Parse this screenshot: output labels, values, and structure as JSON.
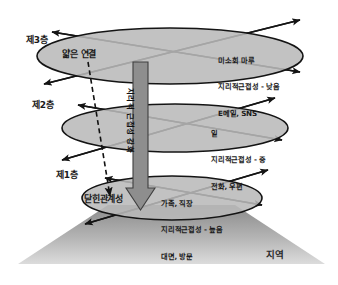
{
  "figure": {
    "ground_label": "지역"
  },
  "colors": {
    "ellipse_fill": "#b9b9b9",
    "ellipse_stroke": "#141414",
    "arrow_stroke": "#141414",
    "center_arrow": "#8e8e8e",
    "center_arrow_stroke": "#3a3a3a",
    "ground_top": "#8a8a8a",
    "ground_bottom": "#d8d8d8",
    "text": "#1a1a1a"
  },
  "tiers": [
    {
      "id": "tier-3",
      "tier_label": "제3층",
      "node_label": "얇은 연결",
      "attributes": [
        "미소회 마루",
        "지리적근접성 - 낮음",
        "E메일, SNS"
      ]
    },
    {
      "id": "tier-2",
      "tier_label": "제2층",
      "node_label": "",
      "attributes": [
        "일",
        "지리적근접성 - 중",
        "전화, 우편"
      ]
    },
    {
      "id": "tier-1",
      "tier_label": "제1층",
      "node_label": "닫힌관계성",
      "attributes": [
        "가족, 직장",
        "지리적근접성 - 높음",
        "대면, 방문"
      ]
    }
  ],
  "center_axis": {
    "label": "지리적 근접성 강화",
    "direction": "down"
  }
}
